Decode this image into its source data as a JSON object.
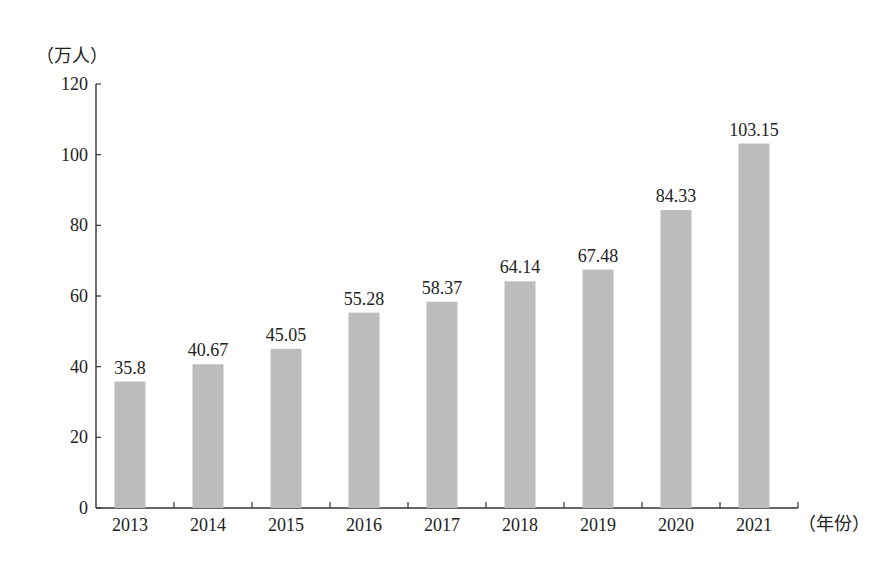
{
  "chart_data": {
    "type": "bar",
    "title": "",
    "xlabel": "（年份）",
    "ylabel": "（万人）",
    "categories": [
      "2013",
      "2014",
      "2015",
      "2016",
      "2017",
      "2018",
      "2019",
      "2020",
      "2021"
    ],
    "values": [
      35.8,
      40.67,
      45.05,
      55.28,
      58.37,
      64.14,
      67.48,
      84.33,
      103.15
    ],
    "value_labels": [
      "35.8",
      "40.67",
      "45.05",
      "55.28",
      "58.37",
      "64.14",
      "67.48",
      "84.33",
      "103.15"
    ],
    "ylim": [
      0,
      120
    ],
    "yticks": [
      0,
      20,
      40,
      60,
      80,
      100,
      120
    ],
    "grid": false,
    "legend": null,
    "bar_color": "#bcbcbc"
  }
}
